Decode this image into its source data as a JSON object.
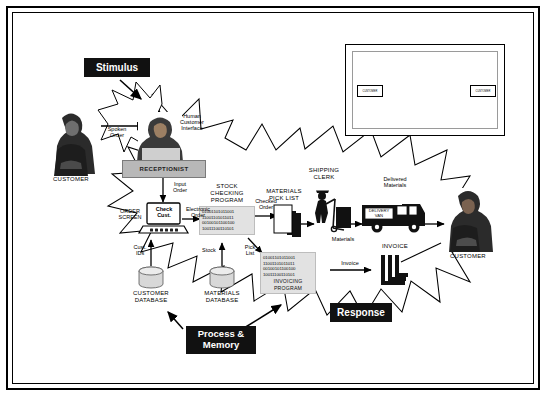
{
  "diagram": {
    "callouts": {
      "stimulus": "Stimulus",
      "process_memory": "Process &\nMemory",
      "response": "Response"
    },
    "actors": {
      "customer_left": "CUSTOMER",
      "customer_right": "CUSTOMER",
      "receptionist": "RECEPTIONIST",
      "shipping_clerk": "SHIPPING\nCLERK"
    },
    "labels": {
      "spoken_order": "Spoken\nOrder",
      "human_customer_interface": "Human\nCustomer\nInterface",
      "input_order": "Input\nOrder",
      "order_screen": "ORDER\nSCREEN",
      "check_cust": "Check\nCust.",
      "electronic_order": "Electronic\nOrder",
      "cust_ids": "Cust.\nIDs",
      "stock": "Stock",
      "pick_list": "Pick\nList",
      "checked_order": "Checked\nOrder",
      "materials_pick_list": "MATERIALS\nPICK LIST",
      "materials": "Materials",
      "delivered_materials": "Delivered\nMaterials",
      "delivery_van": "DELIVERY\nVAN",
      "invoice_flow": "Invoice",
      "invoice_stack": "INVOICE"
    },
    "datastores": {
      "customer_database": "CUSTOMER\nDATABASE",
      "materials_database": "MATERIALS\nDATABASE"
    },
    "programs": {
      "stock_checking": {
        "name": "STOCK\nCHECKING\nPROGRAM",
        "code": [
          "01001101011001",
          "11001101011011",
          "00100101100100",
          "10011100110101"
        ]
      },
      "invoicing": {
        "name": "INVOICING\nPROGRAM",
        "code": [
          "01001101011001",
          "11001101011011",
          "00100101100100",
          "10011100110101"
        ]
      }
    },
    "inset": {
      "entity_source": "CUSTOMER",
      "entity_sink": "CUSTOMER",
      "process_count": 4,
      "datastore_count": 3
    },
    "colors": {
      "callout_bg": "#111111",
      "callout_text": "#ffffff",
      "outline": "#000000",
      "desk": "#b8b8b8",
      "codebox": "#e2e2e2"
    }
  }
}
